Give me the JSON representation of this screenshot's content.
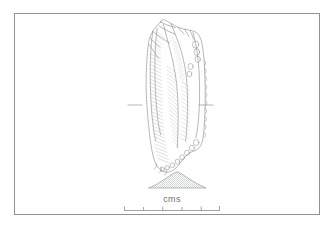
{
  "figure": {
    "type": "archaeological-line-drawing",
    "background_color": "#ffffff",
    "ink_color": "#7e8185",
    "frame": {
      "present": true,
      "color": "#8f9296",
      "x": 14,
      "y": 13,
      "width": 306,
      "height": 202
    }
  },
  "artifact": {
    "name": "flint blade / stone tool illustration",
    "view_label": "dorsal view",
    "bounds": {
      "x": 143,
      "y": 19,
      "width": 63,
      "height": 154
    },
    "section_marks": {
      "left": {
        "x1": 128,
        "x2": 142,
        "y": 105
      },
      "right": {
        "x1": 199,
        "x2": 213,
        "y": 105
      }
    }
  },
  "cross_section": {
    "name": "transverse section profile",
    "bounds": {
      "x": 148,
      "y": 172,
      "width": 58,
      "height": 16
    },
    "fill_style": "stipple"
  },
  "scale": {
    "label": "cms",
    "unit": "cm",
    "bar": {
      "x_start": 124,
      "x_end": 220,
      "y": 210,
      "major_ticks": 6,
      "tick_values": [
        "0",
        "1",
        "2",
        "3",
        "4",
        "5"
      ],
      "color": "#8a8d91"
    }
  }
}
